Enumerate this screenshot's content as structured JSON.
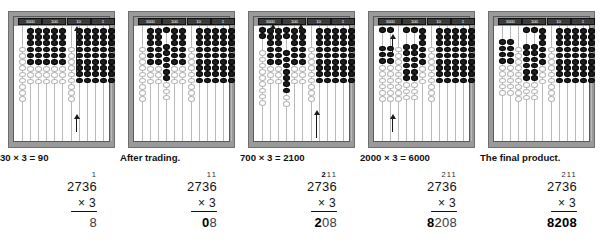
{
  "figure": {
    "place_labels": [
      "1000",
      "100",
      "10",
      "1"
    ],
    "colors": {
      "frame": "#9a9a9a",
      "bead_on": "#1d1d1d",
      "bead_off": "#ffffff",
      "rod": "#b9b9b9",
      "header_box": "#3b3b3b",
      "text": "#111111",
      "faded_text": "#3a3a3a"
    },
    "bead_groups_per_place": 3,
    "rods_total": 12
  },
  "panels": [
    {
      "id": "panel-1",
      "caption": "30 × 3 = 90",
      "carries": "1",
      "carries_bold": "",
      "multiplicand": "2736",
      "multiplier": "× 3",
      "product_bold": "",
      "product_faded": "8",
      "arrows": [
        {
          "x": 62,
          "y": 4,
          "height": 42,
          "dir": "up"
        },
        {
          "x": 62,
          "y": 92,
          "height": 14,
          "dir": "up"
        }
      ],
      "rods": [
        {
          "place": "1000",
          "on": 0,
          "off": 9,
          "on_top": 0
        },
        {
          "place": "1000",
          "on": 6,
          "off": 3,
          "on_top": 0
        },
        {
          "place": "1000",
          "on": 6,
          "off": 3,
          "on_top": 0
        },
        {
          "place": "100",
          "on": 6,
          "off": 3,
          "on_top": 0
        },
        {
          "place": "100",
          "on": 6,
          "off": 3,
          "on_top": 0
        },
        {
          "place": "100",
          "on": 6,
          "off": 3,
          "on_top": 0
        },
        {
          "place": "10",
          "on": 0,
          "off": 9,
          "on_top": 0
        },
        {
          "place": "10",
          "on": 9,
          "off": 0,
          "on_top": 0
        },
        {
          "place": "10",
          "on": 9,
          "off": 0,
          "on_top": 0
        },
        {
          "place": "1",
          "on": 9,
          "off": 0,
          "on_top": 0
        },
        {
          "place": "1",
          "on": 9,
          "off": 0,
          "on_top": 0
        },
        {
          "place": "1",
          "on": 9,
          "off": 0,
          "on_top": 0
        }
      ]
    },
    {
      "id": "panel-2",
      "caption": "After trading.",
      "carries": "11",
      "carries_bold": "",
      "multiplicand": "2736",
      "multiplier": "× 3",
      "product_bold": "0",
      "product_faded": "8",
      "arrows": [],
      "rods": [
        {
          "place": "1000",
          "on": 0,
          "off": 9,
          "on_top": 0
        },
        {
          "place": "1000",
          "on": 6,
          "off": 3,
          "on_top": 0
        },
        {
          "place": "1000",
          "on": 6,
          "off": 3,
          "on_top": 0
        },
        {
          "place": "100",
          "on": 6,
          "off": 3,
          "on_top": 1
        },
        {
          "place": "100",
          "on": 6,
          "off": 3,
          "on_top": 0
        },
        {
          "place": "100",
          "on": 6,
          "off": 3,
          "on_top": 0
        },
        {
          "place": "10",
          "on": 0,
          "off": 9,
          "on_top": 0
        },
        {
          "place": "10",
          "on": 9,
          "off": 0,
          "on_top": 0
        },
        {
          "place": "10",
          "on": 9,
          "off": 0,
          "on_top": 0
        },
        {
          "place": "1",
          "on": 9,
          "off": 0,
          "on_top": 0
        },
        {
          "place": "1",
          "on": 9,
          "off": 0,
          "on_top": 0
        },
        {
          "place": "1",
          "on": 9,
          "off": 0,
          "on_top": 0
        }
      ]
    },
    {
      "id": "panel-3",
      "caption": "700 × 3 = 2100",
      "carries": "211",
      "carries_bold": "2",
      "multiplicand": "2736",
      "multiplier": "× 3",
      "product_bold": "2",
      "product_faded": "08",
      "arrows": [
        {
          "x": 18,
          "y": 2,
          "height": 10,
          "dir": "up"
        },
        {
          "x": 46,
          "y": 2,
          "height": 12,
          "dir": "up"
        },
        {
          "x": 62,
          "y": 88,
          "height": 24,
          "dir": "up"
        }
      ],
      "rods": [
        {
          "place": "1000",
          "on": 0,
          "off": 9,
          "on_top": 2
        },
        {
          "place": "1000",
          "on": 6,
          "off": 3,
          "on_top": 0
        },
        {
          "place": "1000",
          "on": 6,
          "off": 3,
          "on_top": 0
        },
        {
          "place": "100",
          "on": 7,
          "off": 2,
          "on_top": 2
        },
        {
          "place": "100",
          "on": 6,
          "off": 3,
          "on_top": 0
        },
        {
          "place": "100",
          "on": 6,
          "off": 3,
          "on_top": 0
        },
        {
          "place": "10",
          "on": 0,
          "off": 9,
          "on_top": 0
        },
        {
          "place": "10",
          "on": 9,
          "off": 0,
          "on_top": 0
        },
        {
          "place": "10",
          "on": 9,
          "off": 0,
          "on_top": 0
        },
        {
          "place": "1",
          "on": 9,
          "off": 0,
          "on_top": 0
        },
        {
          "place": "1",
          "on": 9,
          "off": 0,
          "on_top": 0
        },
        {
          "place": "1",
          "on": 9,
          "off": 0,
          "on_top": 0
        }
      ]
    },
    {
      "id": "panel-4",
      "caption": "2000 × 3 = 6000",
      "carries": "211",
      "carries_bold": "",
      "multiplicand": "2736",
      "multiplier": "× 3",
      "product_bold": "8",
      "product_faded": "208",
      "arrows": [
        {
          "x": 18,
          "y": 12,
          "height": 16,
          "dir": "up"
        },
        {
          "x": 18,
          "y": 92,
          "height": 14,
          "dir": "up"
        }
      ],
      "rods": [
        {
          "place": "1000",
          "on": 3,
          "off": 6,
          "on_top": 1
        },
        {
          "place": "1000",
          "on": 3,
          "off": 6,
          "on_top": 1
        },
        {
          "place": "1000",
          "on": 0,
          "off": 9,
          "on_top": 0
        },
        {
          "place": "100",
          "on": 6,
          "off": 3,
          "on_top": 1
        },
        {
          "place": "100",
          "on": 6,
          "off": 3,
          "on_top": 1
        },
        {
          "place": "100",
          "on": 6,
          "off": 3,
          "on_top": 0
        },
        {
          "place": "10",
          "on": 0,
          "off": 9,
          "on_top": 0
        },
        {
          "place": "10",
          "on": 9,
          "off": 0,
          "on_top": 0
        },
        {
          "place": "10",
          "on": 9,
          "off": 0,
          "on_top": 0
        },
        {
          "place": "1",
          "on": 9,
          "off": 0,
          "on_top": 0
        },
        {
          "place": "1",
          "on": 9,
          "off": 0,
          "on_top": 0
        },
        {
          "place": "1",
          "on": 9,
          "off": 0,
          "on_top": 0
        }
      ]
    },
    {
      "id": "panel-5",
      "caption": "The final product.",
      "carries": "211",
      "carries_bold": "",
      "multiplicand": "2736",
      "multiplier": "× 3",
      "product_bold": "8208",
      "product_faded": "",
      "arrows": [],
      "rods": [
        {
          "place": "1000",
          "on": 4,
          "off": 5,
          "on_top": 0
        },
        {
          "place": "1000",
          "on": 4,
          "off": 5,
          "on_top": 0
        },
        {
          "place": "1000",
          "on": 0,
          "off": 9,
          "on_top": 0
        },
        {
          "place": "100",
          "on": 6,
          "off": 3,
          "on_top": 1
        },
        {
          "place": "100",
          "on": 6,
          "off": 3,
          "on_top": 1
        },
        {
          "place": "100",
          "on": 6,
          "off": 3,
          "on_top": 0
        },
        {
          "place": "10",
          "on": 0,
          "off": 9,
          "on_top": 0
        },
        {
          "place": "10",
          "on": 9,
          "off": 0,
          "on_top": 0
        },
        {
          "place": "10",
          "on": 9,
          "off": 0,
          "on_top": 0
        },
        {
          "place": "1",
          "on": 9,
          "off": 0,
          "on_top": 0
        },
        {
          "place": "1",
          "on": 9,
          "off": 0,
          "on_top": 0
        },
        {
          "place": "1",
          "on": 9,
          "off": 0,
          "on_top": 0
        }
      ]
    }
  ]
}
